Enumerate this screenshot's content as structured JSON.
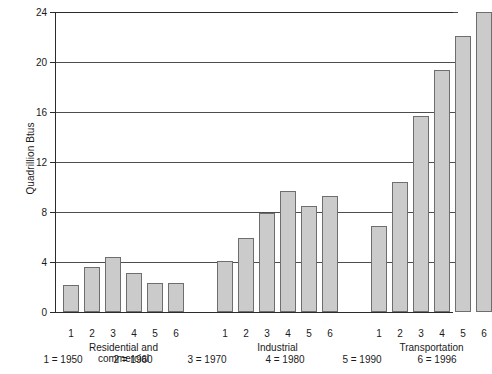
{
  "chart_data": {
    "type": "bar",
    "title": "",
    "xlabel": "",
    "ylabel": "Quadrillion Btus",
    "ylim": [
      0,
      24
    ],
    "yticks": [
      0,
      4,
      8,
      12,
      16,
      20,
      24
    ],
    "ytick_labels": [
      "0",
      "4",
      "8",
      "12",
      "16",
      "20",
      "24"
    ],
    "grid": true,
    "legend_position": "below-axis",
    "categories": [
      "1",
      "2",
      "3",
      "4",
      "5",
      "6"
    ],
    "groups": [
      {
        "name": "Residential and\ncommercial",
        "tick_labels": [
          "1",
          "2",
          "3",
          "4",
          "5",
          "6"
        ],
        "values": [
          2.2,
          3.6,
          4.4,
          3.1,
          2.3,
          2.3
        ]
      },
      {
        "name": "Industrial",
        "tick_labels": [
          "1",
          "2",
          "3",
          "4",
          "5",
          "6"
        ],
        "values": [
          4.1,
          5.9,
          7.9,
          9.7,
          8.5,
          9.3
        ]
      },
      {
        "name": "Transportation",
        "tick_labels": [
          "1",
          "2",
          "3",
          "4",
          "5",
          "6"
        ],
        "values": [
          6.9,
          10.4,
          15.7,
          19.4,
          22.1,
          24.0
        ]
      }
    ],
    "key": [
      "1 = 1950",
      "2 = 1960",
      "3 = 1970",
      "4 = 1980",
      "5 = 1990",
      "6 = 1996"
    ],
    "colors": {
      "bar_fill": "#cbcbcb",
      "bar_stroke": "#6e6e6e",
      "axis": "#2b2b2b",
      "gridline": "#4d4d4d",
      "background": "#ffffff",
      "text": "#1a1a1a"
    }
  }
}
